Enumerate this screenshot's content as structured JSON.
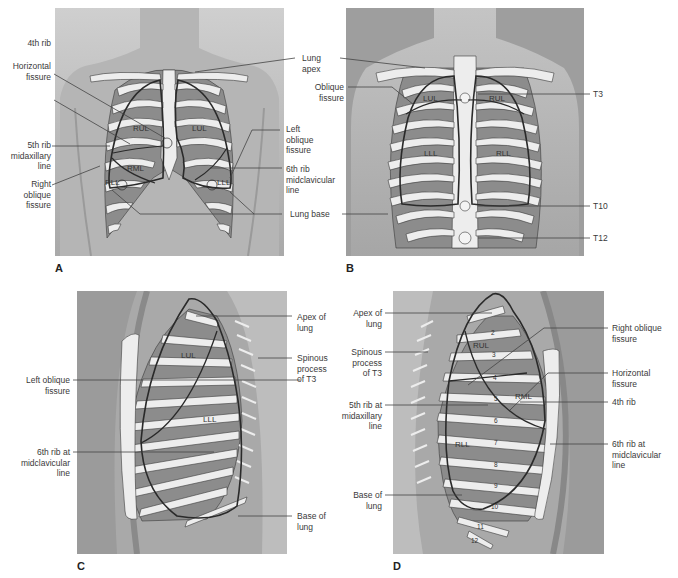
{
  "figure": {
    "colors": {
      "background": "#ffffff",
      "skin": "#b9b9b9",
      "skin_dark": "#9c9c9c",
      "lung_fill": "#8e8e8e",
      "rib_fill": "#efefef",
      "outline": "#2e2e2e",
      "leader_line": "#444444"
    },
    "panels": [
      {
        "id": "A",
        "view": "anterior",
        "panel_label": "A",
        "lobes": [
          "RUL",
          "LUL",
          "RML",
          "RLL",
          "LLL"
        ],
        "labels_left": [
          {
            "text": "4th rib"
          },
          {
            "text": "Horizontal\nfissure"
          },
          {
            "text": "5th rib\nmidaxillary\nline"
          },
          {
            "text": "Right\noblique\nfissure"
          }
        ],
        "labels_right": [
          {
            "text": "Lung\napex"
          },
          {
            "text": "Left\noblique\nfissure"
          },
          {
            "text": "6th rib\nmidclavicular\nline"
          },
          {
            "text": "Lung base"
          }
        ]
      },
      {
        "id": "B",
        "view": "posterior",
        "panel_label": "B",
        "lobes": [
          "LUL",
          "RUL",
          "LLL",
          "RLL"
        ],
        "labels_left": [
          {
            "text": "Oblique\nfissure"
          }
        ],
        "labels_right": [
          {
            "text": "T3"
          },
          {
            "text": "T10"
          },
          {
            "text": "T12"
          }
        ]
      },
      {
        "id": "C",
        "view": "left lateral",
        "panel_label": "C",
        "lobes": [
          "LUL",
          "LLL"
        ],
        "labels_left": [
          {
            "text": "Left oblique\nfissure"
          },
          {
            "text": "6th rib at\nmidclavicular\nline"
          }
        ],
        "labels_right": [
          {
            "text": "Apex of\nlung"
          },
          {
            "text": "Spinous\nprocess\nof T3"
          },
          {
            "text": "Base of\nlung"
          }
        ]
      },
      {
        "id": "D",
        "view": "right lateral",
        "panel_label": "D",
        "lobes": [
          "RUL",
          "RML",
          "RLL"
        ],
        "rib_numbers": [
          "2",
          "3",
          "4",
          "5",
          "6",
          "7",
          "8",
          "9",
          "10",
          "11",
          "12"
        ],
        "labels_left": [
          {
            "text": "Apex of\nlung"
          },
          {
            "text": "Spinous\nprocess\nof T3"
          },
          {
            "text": "5th rib at\nmidaxillary\nline"
          },
          {
            "text": "Base of\nlung"
          }
        ],
        "labels_right": [
          {
            "text": "Right oblique\nfissure"
          },
          {
            "text": "Horizontal\nfissure"
          },
          {
            "text": "4th rib"
          },
          {
            "text": "6th rib at\nmidclavicular\nline"
          }
        ]
      }
    ]
  }
}
